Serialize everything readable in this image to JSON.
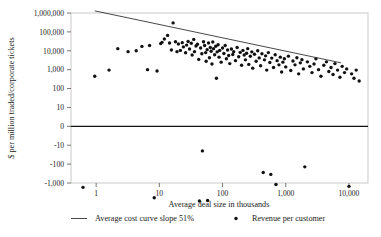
{
  "chart_data": {
    "type": "scatter",
    "title": "",
    "xlabel": "Average deal size in thousands",
    "ylabel": "$ per million traded/corporate tickets",
    "xscale": "log",
    "yscale": "symlog",
    "xlim": [
      0.4,
      20000
    ],
    "ylim": [
      -1000,
      1000000
    ],
    "grid": false,
    "legend_position": "bottom",
    "x_tick_labels": [
      "1",
      "10",
      "100",
      "1,000",
      "10,000"
    ],
    "x_tick_values": [
      1,
      10,
      100,
      1000,
      10000
    ],
    "y_tick_labels": [
      "1,000,000",
      "100,000",
      "10,000",
      "1,000",
      "100",
      "10",
      "0",
      "-10",
      "-100",
      "-1,000"
    ],
    "y_tick_values": [
      1000000,
      100000,
      10000,
      1000,
      100,
      10,
      0,
      -10,
      -100,
      -1000
    ],
    "zero_line": 0,
    "legend": [
      {
        "key": "trendline",
        "marker": "line",
        "label": "Average cost curve slope 51%"
      },
      {
        "key": "points",
        "marker": "dot",
        "label": "Revenue per customer"
      }
    ],
    "series": [
      {
        "name": "Average cost curve slope 51%",
        "type": "line",
        "points": [
          [
            0.95,
            130000
          ],
          [
            7500,
            230
          ]
        ]
      },
      {
        "name": "Revenue per customer",
        "type": "scatter",
        "points": [
          [
            0.62,
            -170
          ],
          [
            0.95,
            45
          ],
          [
            1.6,
            95
          ],
          [
            2.2,
            1300
          ],
          [
            3.2,
            900
          ],
          [
            4.3,
            1000
          ],
          [
            5.3,
            1700
          ],
          [
            6.5,
            100
          ],
          [
            7.0,
            1900
          ],
          [
            8.3,
            -600
          ],
          [
            9.2,
            85
          ],
          [
            10.5,
            2400
          ],
          [
            11.0,
            2800
          ],
          [
            12.0,
            4200
          ],
          [
            13.5,
            6500
          ],
          [
            14.5,
            2600
          ],
          [
            15.5,
            1100
          ],
          [
            16.5,
            30000
          ],
          [
            18.0,
            3000
          ],
          [
            19.0,
            900
          ],
          [
            20.0,
            2300
          ],
          [
            21.5,
            1050
          ],
          [
            23.0,
            2700
          ],
          [
            24.0,
            1600
          ],
          [
            26.0,
            780
          ],
          [
            27.0,
            2000
          ],
          [
            28.5,
            3100
          ],
          [
            30.0,
            1250
          ],
          [
            32.0,
            2500
          ],
          [
            33.0,
            600
          ],
          [
            35.0,
            4000
          ],
          [
            36.0,
            900
          ],
          [
            38.0,
            1800
          ],
          [
            40.0,
            2200
          ],
          [
            42.0,
            350
          ],
          [
            43.0,
            -900
          ],
          [
            45.0,
            1400
          ],
          [
            47.0,
            700
          ],
          [
            48.0,
            -2
          ],
          [
            50.0,
            3000
          ],
          [
            52.0,
            1900
          ],
          [
            54.0,
            800
          ],
          [
            55.0,
            280
          ],
          [
            57.0,
            1150
          ],
          [
            58.0,
            -850
          ],
          [
            60.0,
            2600
          ],
          [
            62.0,
            430
          ],
          [
            64.0,
            1500
          ],
          [
            66.0,
            950
          ],
          [
            68.0,
            200
          ],
          [
            70.0,
            2900
          ],
          [
            72.0,
            1300
          ],
          [
            75.0,
            620
          ],
          [
            78.0,
            1750
          ],
          [
            80.0,
            35
          ],
          [
            82.0,
            880
          ],
          [
            85.0,
            2100
          ],
          [
            88.0,
            460
          ],
          [
            90.0,
            1050
          ],
          [
            95.0,
            250
          ],
          [
            100.0,
            1400
          ],
          [
            105.0,
            720
          ],
          [
            110.0,
            1900
          ],
          [
            115.0,
            380
          ],
          [
            120.0,
            1100
          ],
          [
            125.0,
            560
          ],
          [
            130.0,
            210
          ],
          [
            138.0,
            1250
          ],
          [
            145.0,
            640
          ],
          [
            150.0,
            900
          ],
          [
            160.0,
            300
          ],
          [
            170.0,
            1500
          ],
          [
            180.0,
            480
          ],
          [
            190.0,
            820
          ],
          [
            200.0,
            170
          ],
          [
            210.0,
            1050
          ],
          [
            220.0,
            600
          ],
          [
            230.0,
            330
          ],
          [
            240.0,
            740
          ],
          [
            250.0,
            1300
          ],
          [
            260.0,
            190
          ],
          [
            275.0,
            510
          ],
          [
            290.0,
            880
          ],
          [
            300.0,
            120
          ],
          [
            320.0,
            650
          ],
          [
            340.0,
            280
          ],
          [
            360.0,
            1000
          ],
          [
            380.0,
            420
          ],
          [
            400.0,
            160
          ],
          [
            420.0,
            700
          ],
          [
            440.0,
            -28
          ],
          [
            460.0,
            330
          ],
          [
            480.0,
            540
          ],
          [
            500.0,
            95
          ],
          [
            530.0,
            800
          ],
          [
            560.0,
            240
          ],
          [
            580.0,
            -35
          ],
          [
            600.0,
            410
          ],
          [
            640.0,
            130
          ],
          [
            680.0,
            620
          ],
          [
            700.0,
            -120
          ],
          [
            730.0,
            300
          ],
          [
            780.0,
            180
          ],
          [
            820.0,
            460
          ],
          [
            860.0,
            75
          ],
          [
            900.0,
            250
          ],
          [
            950.0,
            380
          ],
          [
            1000.0,
            140
          ],
          [
            1100.0,
            520
          ],
          [
            1200.0,
            90
          ],
          [
            1300.0,
            290
          ],
          [
            1400.0,
            180
          ],
          [
            1500.0,
            430
          ],
          [
            1600.0,
            60
          ],
          [
            1700.0,
            230
          ],
          [
            1800.0,
            340
          ],
          [
            1900.0,
            110
          ],
          [
            2000.0,
            -14
          ],
          [
            2200.0,
            260
          ],
          [
            2400.0,
            150
          ],
          [
            2600.0,
            70
          ],
          [
            2800.0,
            200
          ],
          [
            3000.0,
            380
          ],
          [
            3300.0,
            100
          ],
          [
            3600.0,
            45
          ],
          [
            4000.0,
            170
          ],
          [
            4400.0,
            260
          ],
          [
            4800.0,
            80
          ],
          [
            5200.0,
            130
          ],
          [
            5600.0,
            55
          ],
          [
            6000.0,
            210
          ],
          [
            6600.0,
            95
          ],
          [
            7200.0,
            40
          ],
          [
            7800.0,
            150
          ],
          [
            8500.0,
            70
          ],
          [
            9200.0,
            110
          ],
          [
            10000.0,
            -150
          ],
          [
            11000.0,
            60
          ],
          [
            12000.0,
            35
          ],
          [
            13000.0,
            95
          ],
          [
            14500.0,
            25
          ]
        ]
      }
    ]
  }
}
